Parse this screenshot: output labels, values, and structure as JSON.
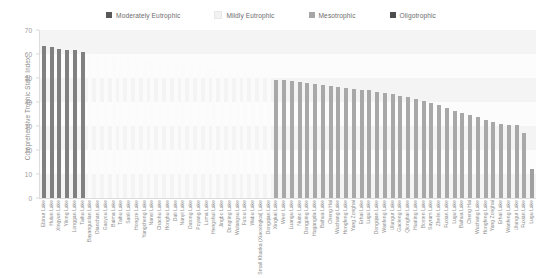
{
  "legend": {
    "position": "top-center",
    "items": [
      {
        "label": "Moderately Eutrophic",
        "color": "#595959",
        "swatch_icon": "square-swatch-icon"
      },
      {
        "label": "Mildly Eutrophic",
        "color": "#f2f2f2",
        "swatch_icon": "square-swatch-icon"
      },
      {
        "label": "Mesotrophic",
        "color": "#a6a6a6",
        "swatch_icon": "square-swatch-icon"
      },
      {
        "label": "Oligotrophic",
        "color": "#4d4d4d",
        "swatch_icon": "square-swatch-icon"
      }
    ]
  },
  "axes": {
    "ylabel": "Comprehensive Trophic State Index",
    "yticks": [
      70,
      60,
      50,
      40,
      30,
      20,
      10,
      0
    ],
    "ylim": [
      0,
      70
    ]
  },
  "chart_data": {
    "type": "bar",
    "title": "",
    "subtitle": "",
    "xlabel": "",
    "ylabel": "Comprehensive Trophic State Index",
    "ylim": [
      0,
      70
    ],
    "xlim_categories_count": 64,
    "grid": true,
    "legend_position": "top-center",
    "annotations": [],
    "series": [
      {
        "name": "Comprehensive Trophic State Index",
        "categories": [
          "Ebinur Lake",
          "Hulun Lake",
          "Xingyun Lake",
          "Yilong Lake",
          "Longgan Lake",
          "Taihu Lake",
          "Bayanguolan Lake",
          "Dianchan Lake",
          "Gaoyou Lake",
          "Baima Lake",
          "Taihu Lake",
          "Sanli Lake",
          "Hongze Lake",
          "Yangcheng Lake",
          "Nansi Lake",
          "Chaohu Lake",
          "Honghu Lake",
          "Dali Lake",
          "Nanyi Lake",
          "Datong Lake",
          "Poyang Lake",
          "Hengshui Lake",
          "Jingbo Lake",
          "Dongting Lake",
          "Wulangsu Lake",
          "Futou Lake",
          "Wabu Lake",
          "Small Khanka (Xiaoxingkai) Lake",
          "Dongqian Lake",
          "Xingkai Lake",
          "West Lake",
          "Luangu Lake",
          "Nuino Lake",
          "Dongping Lake",
          "Hugangda Lake",
          "Baihua Lake",
          "Cheng Hai",
          "Wuchang Lake",
          "Hongfeng Lake",
          "Yang Zonghai",
          "Erhai Lake",
          "Lugu Lake",
          "Loma Lake",
          "Wanfeng Lake",
          "Ulungur Lake",
          "Gaoleng Lake",
          "Qionghai Lake",
          "Huating Lake",
          "Bosten Lake",
          "Sayram Lake",
          "Zhelin Lake",
          "Fuxian Lake",
          "Lugu Lake",
          "Dongqian Lake",
          "Baihua Lake",
          "Cheng Hai",
          "Wuchang Lake",
          "Hongfeng Lake",
          "Yang Zonghai",
          "Erhai Lake",
          "Wanfeng Lake",
          "Ulungur Lake",
          "Gaoleng Lake",
          "Qionghai Lake"
        ],
        "values": [
          63.4,
          63.0,
          62.1,
          61.8,
          61.6,
          61.0,
          60.0,
          59.6,
          59.3,
          59.0,
          58.6,
          58.2,
          57.9,
          57.5,
          57.1,
          56.8,
          56.4,
          56.0,
          55.6,
          55.2,
          54.8,
          54.4,
          54.0,
          53.6,
          53.2,
          52.8,
          52.4,
          52.0,
          51.6,
          51.2,
          49.3,
          49.0,
          48.7,
          48.4,
          48.0,
          47.6,
          47.2,
          46.8,
          46.4,
          46.0,
          45.6,
          45.2,
          44.8,
          44.3,
          43.8,
          43.2,
          42.6,
          42.0,
          41.2,
          40.4,
          39.6,
          38.8,
          37.6,
          36.4,
          35.4,
          34.6,
          33.6,
          32.4,
          31.6,
          31.0,
          30.6,
          30.4,
          27.0,
          12.0
        ],
        "categories_display": [
          "Ebinur Lake",
          "Hulun Lake",
          "Xingyun Lake",
          "Yilong Lake",
          "Longgan Lake",
          "Taihu Lake",
          "Bayanguolan Lake",
          "Dianchan Lake",
          "Gaoyou Lake",
          "Baima Lake",
          "Taihu Lake",
          "Sanli Lake",
          "Hongze Lake",
          "Yangcheng Lake",
          "Nansi Lake",
          "Chaohu Lake",
          "Honghu Lake",
          "Dali Lake",
          "Nanyi Lake",
          "Datong Lake",
          "Poyang Lake",
          "Loma Lake",
          "Hengshui Lake",
          "Jingbo Lake",
          "Dongting Lake",
          "Wulangsu Lake",
          "Futou Lake",
          "Wabu Lake",
          "Small Khanka (Xiaoxingkai) Lake",
          "Dongqian Lake",
          "Xingkai Lake",
          "West Lake",
          "Luangu Lake",
          "Nuino Lake",
          "Dongping Lake",
          "Hugangda Lake",
          "Baihua Lake",
          "Cheng Hai",
          "Wuchang Lake",
          "Hongfeng Lake",
          "Yang Zonghai",
          "Erhai Lake",
          "Lugu Lake",
          "Dongqian Lake",
          "Wanfeng Lake",
          "Ulungur Lake",
          "Gaoleng Lake",
          "Qionghai Lake",
          "Huating Lake",
          "Bosten Lake",
          "Sayram Lake",
          "Zhelin Lake",
          "Fuxian Lake",
          "Lugu Lake",
          "Baihua Lake",
          "Cheng Hai",
          "Wuchang Lake",
          "Hongfeng Lake",
          "Yang Zonghai",
          "Erhai Lake",
          "Wanfeng Lake",
          "Ulungur Lake",
          "Fuxian Lake",
          "Lugu Lake"
        ],
        "categories_class": [
          "moderately",
          "moderately",
          "moderately",
          "moderately",
          "moderately",
          "moderately",
          "mildly",
          "mildly",
          "mildly",
          "mildly",
          "mildly",
          "mildly",
          "mildly",
          "mildly",
          "mildly",
          "mildly",
          "mildly",
          "mildly",
          "mildly",
          "mildly",
          "mildly",
          "mildly",
          "mildly",
          "mildly",
          "mildly",
          "mildly",
          "mildly",
          "mildly",
          "mildly",
          "mildly",
          "mesotrophic",
          "mesotrophic",
          "mesotrophic",
          "mesotrophic",
          "mesotrophic",
          "mesotrophic",
          "mesotrophic",
          "mesotrophic",
          "mesotrophic",
          "mesotrophic",
          "mesotrophic",
          "mesotrophic",
          "mesotrophic",
          "mesotrophic",
          "mesotrophic",
          "mesotrophic",
          "mesotrophic",
          "mesotrophic",
          "mesotrophic",
          "mesotrophic",
          "mesotrophic",
          "mesotrophic",
          "mesotrophic",
          "mesotrophic",
          "mesotrophic",
          "mesotrophic",
          "mesotrophic",
          "mesotrophic",
          "mesotrophic",
          "mesotrophic",
          "mesotrophic",
          "mesotrophic",
          "mesotrophic",
          "oligotrophic"
        ]
      }
    ],
    "class_colors": {
      "moderately": "#808080",
      "mildly": "#fbfbfb",
      "mesotrophic": "#a8a8a8",
      "oligotrophic": "#a0a0a0"
    }
  }
}
